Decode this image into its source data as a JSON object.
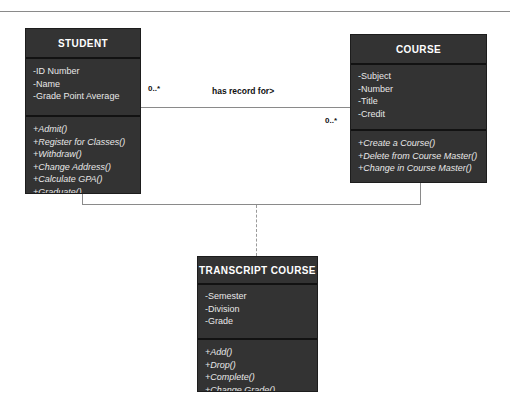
{
  "diagram": {
    "type": "uml-class-diagram",
    "background": "#ffffff",
    "box_fill": "#333333",
    "box_text": "#f2f2f2",
    "line_color": "#8a8a8a"
  },
  "classes": {
    "student": {
      "name": "STUDENT",
      "attributes": [
        "-ID Number",
        "-Name",
        "-Grade Point Average"
      ],
      "operations": [
        "+Admit()",
        "+Register for Classes()",
        "+Withdraw()",
        "+Change Address()",
        "+Calculate GPA()",
        "+Graduate()"
      ]
    },
    "course": {
      "name": "COURSE",
      "attributes": [
        "-Subject",
        "-Number",
        "-Title",
        "-Credit"
      ],
      "operations": [
        "+Create a Course()",
        "+Delete from Course Master()",
        "+Change in Course Master()"
      ]
    },
    "transcript_course": {
      "name": "TRANSCRIPT COURSE",
      "attributes": [
        "-Semester",
        "-Division",
        "-Grade"
      ],
      "operations": [
        "+Add()",
        "+Drop()",
        "+Complete()",
        "+Change Grade()"
      ]
    }
  },
  "association": {
    "label": "has record for>",
    "multiplicity_student_end": "0..*",
    "multiplicity_course_end": "0..*"
  }
}
